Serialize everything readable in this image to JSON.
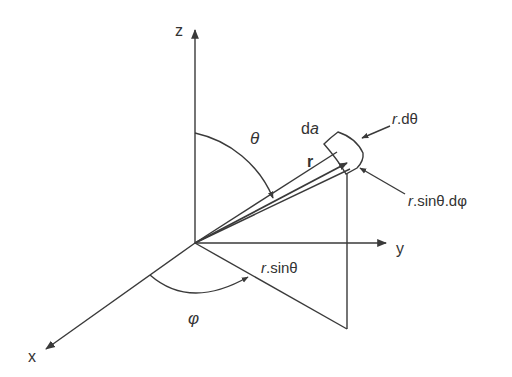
{
  "axes": {
    "x": "x",
    "y": "y",
    "z": "z"
  },
  "labels": {
    "theta": "θ",
    "phi": "φ",
    "r": "r",
    "da_d": "d",
    "da_a": "a",
    "r_dtheta_r": "r",
    "r_dtheta_rest": ".dθ",
    "r_sin_dphi_r": "r",
    "r_sin_dphi_rest": ".sinθ.dφ",
    "r_sin_r": "r",
    "r_sin_rest": ".sinθ"
  },
  "colors": {
    "stroke": "#3a3a3a"
  }
}
